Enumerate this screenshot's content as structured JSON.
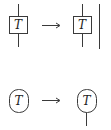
{
  "diagram": {
    "rows": [
      {
        "left": {
          "shape": "box",
          "label": "T",
          "wire": "through"
        },
        "arrow": "long-right-arrow",
        "right": {
          "shape": "box",
          "label": "T",
          "wire": "through",
          "extra": "parallel-vertical-wire"
        }
      },
      {
        "left": {
          "shape": "oval",
          "label": "T",
          "wire": "none"
        },
        "arrow": "long-right-arrow",
        "right": {
          "shape": "oval",
          "label": "T",
          "wire": "bottom-leg"
        }
      }
    ],
    "colors": {
      "stroke": "#3a3a3a",
      "text": "#222222",
      "background": "#ffffff"
    }
  }
}
